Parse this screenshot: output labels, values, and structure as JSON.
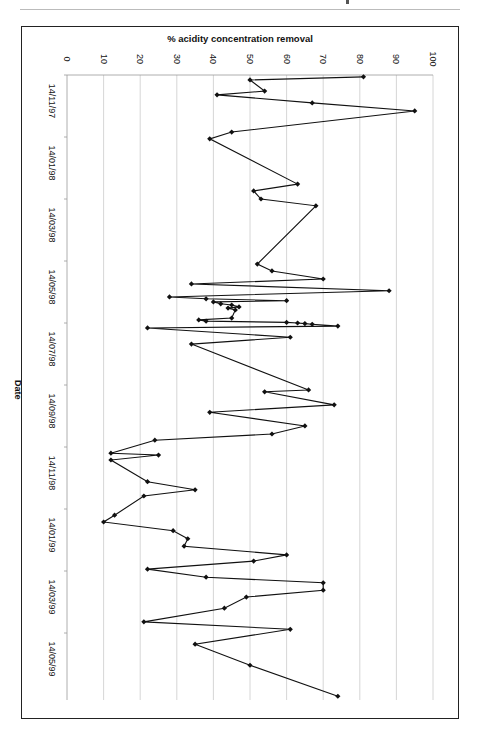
{
  "page": {
    "chart_title": "% acidity concentration removal",
    "x_axis_title": "Date"
  },
  "chart_data": {
    "type": "line",
    "orientation": "rotated 90deg clockwise (values on horizontal axis, dates on vertical axis)",
    "title": "% acidity concentration removal",
    "xlabel": "Date",
    "ylabel": "% acidity concentration removal",
    "ylim": [
      0,
      100
    ],
    "y_ticks": [
      0,
      10,
      20,
      30,
      40,
      50,
      60,
      70,
      80,
      90,
      100
    ],
    "x_tick_labels": [
      "14/11/97",
      "14/01/98",
      "14/03/98",
      "14/05/98",
      "14/07/98",
      "14/09/98",
      "14/11/98",
      "14/01/99",
      "14/03/99",
      "14/05/99"
    ],
    "grid": true,
    "legend": null,
    "marker": "diamond",
    "series": [
      {
        "name": "% acidity concentration removal",
        "points": [
          {
            "date_pos": 0.03,
            "value": 81
          },
          {
            "date_pos": 0.08,
            "value": 50
          },
          {
            "date_pos": 0.26,
            "value": 54
          },
          {
            "date_pos": 0.32,
            "value": 41
          },
          {
            "date_pos": 0.45,
            "value": 67
          },
          {
            "date_pos": 0.58,
            "value": 95
          },
          {
            "date_pos": 0.92,
            "value": 45
          },
          {
            "date_pos": 1.03,
            "value": 39
          },
          {
            "date_pos": 1.76,
            "value": 63
          },
          {
            "date_pos": 1.87,
            "value": 51
          },
          {
            "date_pos": 2.0,
            "value": 53
          },
          {
            "date_pos": 2.11,
            "value": 68
          },
          {
            "date_pos": 3.05,
            "value": 52
          },
          {
            "date_pos": 3.16,
            "value": 56
          },
          {
            "date_pos": 3.29,
            "value": 70
          },
          {
            "date_pos": 3.37,
            "value": 34
          },
          {
            "date_pos": 3.48,
            "value": 88
          },
          {
            "date_pos": 3.58,
            "value": 28
          },
          {
            "date_pos": 3.61,
            "value": 38
          },
          {
            "date_pos": 3.64,
            "value": 60
          },
          {
            "date_pos": 3.66,
            "value": 40
          },
          {
            "date_pos": 3.69,
            "value": 42
          },
          {
            "date_pos": 3.71,
            "value": 45
          },
          {
            "date_pos": 3.74,
            "value": 47
          },
          {
            "date_pos": 3.76,
            "value": 44
          },
          {
            "date_pos": 3.79,
            "value": 46
          },
          {
            "date_pos": 3.92,
            "value": 45
          },
          {
            "date_pos": 3.95,
            "value": 36
          },
          {
            "date_pos": 3.97,
            "value": 38
          },
          {
            "date_pos": 3.99,
            "value": 60
          },
          {
            "date_pos": 4.0,
            "value": 63
          },
          {
            "date_pos": 4.01,
            "value": 65
          },
          {
            "date_pos": 4.02,
            "value": 67
          },
          {
            "date_pos": 4.05,
            "value": 74
          },
          {
            "date_pos": 4.08,
            "value": 22
          },
          {
            "date_pos": 4.23,
            "value": 61
          },
          {
            "date_pos": 4.34,
            "value": 34
          },
          {
            "date_pos": 5.08,
            "value": 66
          },
          {
            "date_pos": 5.11,
            "value": 54
          },
          {
            "date_pos": 5.32,
            "value": 73
          },
          {
            "date_pos": 5.44,
            "value": 39
          },
          {
            "date_pos": 5.66,
            "value": 65
          },
          {
            "date_pos": 5.79,
            "value": 56
          },
          {
            "date_pos": 5.89,
            "value": 24
          },
          {
            "date_pos": 6.1,
            "value": 12
          },
          {
            "date_pos": 6.13,
            "value": 25
          },
          {
            "date_pos": 6.21,
            "value": 12
          },
          {
            "date_pos": 6.56,
            "value": 22
          },
          {
            "date_pos": 6.69,
            "value": 35
          },
          {
            "date_pos": 6.79,
            "value": 21
          },
          {
            "date_pos": 7.1,
            "value": 13
          },
          {
            "date_pos": 7.21,
            "value": 10
          },
          {
            "date_pos": 7.35,
            "value": 29
          },
          {
            "date_pos": 7.48,
            "value": 33
          },
          {
            "date_pos": 7.6,
            "value": 32
          },
          {
            "date_pos": 7.74,
            "value": 60
          },
          {
            "date_pos": 7.84,
            "value": 51
          },
          {
            "date_pos": 7.97,
            "value": 22
          },
          {
            "date_pos": 8.1,
            "value": 38
          },
          {
            "date_pos": 8.19,
            "value": 70
          },
          {
            "date_pos": 8.31,
            "value": 70
          },
          {
            "date_pos": 8.42,
            "value": 49
          },
          {
            "date_pos": 8.6,
            "value": 43
          },
          {
            "date_pos": 8.82,
            "value": 21
          },
          {
            "date_pos": 8.94,
            "value": 61
          },
          {
            "date_pos": 9.18,
            "value": 35
          },
          {
            "date_pos": 9.52,
            "value": 50
          },
          {
            "date_pos": 10.02,
            "value": 74
          }
        ]
      }
    ],
    "note": "date_pos = position in units of 2-month tick intervals from 14/11/97 (0) ; values estimated from gridlines"
  }
}
